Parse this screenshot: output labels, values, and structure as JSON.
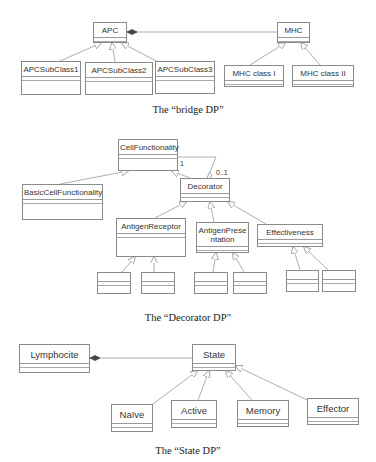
{
  "diagrams": {
    "bridge": {
      "caption": "The “bridge DP”",
      "classes": {
        "apc": "APC",
        "mhc": "MHC",
        "apc_sub1": "APCSubClass1",
        "apc_sub2": "APCSubClass2",
        "apc_sub3": "APCSubClass3",
        "mhc_class1": "MHC class I",
        "mhc_class2": "MHC class II"
      },
      "relations": [
        {
          "type": "composition",
          "from": "APC",
          "to": "MHC"
        },
        {
          "type": "generalization",
          "child": "APCSubClass1",
          "parent": "APC"
        },
        {
          "type": "generalization",
          "child": "APCSubClass2",
          "parent": "APC"
        },
        {
          "type": "generalization",
          "child": "APCSubClass3",
          "parent": "APC"
        },
        {
          "type": "generalization",
          "child": "MHC class I",
          "parent": "MHC"
        },
        {
          "type": "generalization",
          "child": "MHC class II",
          "parent": "MHC"
        }
      ]
    },
    "decorator": {
      "caption": "The “Decorator DP”",
      "classes": {
        "cell_functionality": "CellFunctionality",
        "basic_cell_functionality": "BasicCellFunctionality",
        "decorator": "Decorator",
        "antigen_receptor": "AntigenReceptor",
        "antigen_presentation": "AntigenPrese\nntation",
        "effectiveness": "Effectiveness"
      },
      "multiplicity": {
        "cell_end": "1",
        "decorator_end": "0..1"
      },
      "relations": [
        {
          "type": "generalization",
          "child": "BasicCellFunctionality",
          "parent": "CellFunctionality"
        },
        {
          "type": "generalization",
          "child": "Decorator",
          "parent": "CellFunctionality"
        },
        {
          "type": "aggregation",
          "whole": "Decorator",
          "part": "CellFunctionality"
        },
        {
          "type": "generalization",
          "child": "AntigenReceptor",
          "parent": "Decorator"
        },
        {
          "type": "generalization",
          "child": "AntigenPresentation",
          "parent": "Decorator"
        },
        {
          "type": "generalization",
          "child": "Effectiveness",
          "parent": "Decorator"
        }
      ],
      "unnamed_subclass_count": 6
    },
    "state": {
      "caption": "The “State DP”",
      "classes": {
        "lymphocite": "Lymphocite",
        "state": "State",
        "naive": "Naïve",
        "active": "Active",
        "memory": "Memory",
        "effector": "Effector"
      },
      "relations": [
        {
          "type": "composition",
          "from": "Lymphocite",
          "to": "State"
        },
        {
          "type": "generalization",
          "child": "Naïve",
          "parent": "State"
        },
        {
          "type": "generalization",
          "child": "Active",
          "parent": "State"
        },
        {
          "type": "generalization",
          "child": "Memory",
          "parent": "State"
        },
        {
          "type": "generalization",
          "child": "Effector",
          "parent": "State"
        }
      ]
    }
  },
  "colors": {
    "line": "#8a8a8a",
    "text": "#333333",
    "background": "#ffffff"
  }
}
